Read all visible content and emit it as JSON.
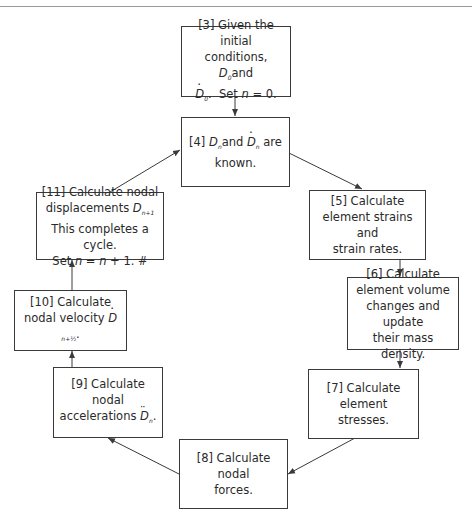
{
  "diagram": {
    "type": "cycle-flowchart",
    "nodes": [
      {
        "id": "3",
        "label": "[3] Given the initial conditions, D0 and Ḋ0. Set n = 0.",
        "lines": [
          "[3] Given the initial",
          "conditions, ",
          "D",
          "0",
          " and",
          "D",
          "0",
          ". Set ",
          "n",
          " = 0."
        ]
      },
      {
        "id": "4",
        "label": "[4] Dn and Ḋn are known."
      },
      {
        "id": "5",
        "label": "[5] Calculate element strains and strain rates.",
        "lines": [
          "[5] Calculate",
          "element strains and",
          "strain rates."
        ]
      },
      {
        "id": "6",
        "label": "[6] Calculate element volume changes and update their mass density.",
        "lines": [
          "[6] Calculate",
          "element volume",
          "changes and update",
          "their mass density."
        ]
      },
      {
        "id": "7",
        "label": "[7] Calculate element stresses.",
        "lines": [
          "[7] Calculate",
          "element stresses."
        ]
      },
      {
        "id": "8",
        "label": "[8] Calculate nodal forces.",
        "lines": [
          "[8] Calculate nodal",
          "forces."
        ]
      },
      {
        "id": "9",
        "label": "[9] Calculate nodal accelerations D̈n.",
        "lines": [
          "[9] Calculate nodal",
          "accelerations "
        ]
      },
      {
        "id": "10",
        "label": "[10] Calculate nodal velocity Ḋn+1/2.",
        "lines": [
          "[10] Calculate",
          "nodal velocity "
        ]
      },
      {
        "id": "11",
        "label": "[11] Calculate nodal displacements Dn+1. This completes a cycle. Set n = n + 1. #",
        "lines": [
          "[11] Calculate nodal",
          "displacements ",
          "This completes a cycle.",
          "Set ",
          "n",
          " = ",
          "n",
          " + 1. #"
        ]
      }
    ],
    "edges": [
      {
        "from": "3",
        "to": "4"
      },
      {
        "from": "4",
        "to": "5"
      },
      {
        "from": "5",
        "to": "6"
      },
      {
        "from": "6",
        "to": "7"
      },
      {
        "from": "7",
        "to": "8"
      },
      {
        "from": "8",
        "to": "9"
      },
      {
        "from": "9",
        "to": "10"
      },
      {
        "from": "10",
        "to": "11"
      },
      {
        "from": "11",
        "to": "4"
      }
    ]
  },
  "text": {
    "n3_l1": "[3] Given the initial",
    "n3_l2a": "conditions,",
    "D": "D",
    "sub0": "0",
    "subn": "n",
    "subn1": "n+1",
    "subnhalf": "n+½",
    "and": "and",
    "are": "are",
    "period": ".",
    "set": "Set",
    "n": "n",
    "eq0": "= 0.",
    "n4_l1a": "[4]",
    "n4_l2": "known.",
    "n5_l1": "[5] Calculate",
    "n5_l2": "element strains and",
    "n5_l3": "strain rates.",
    "n6_l1": "[6] Calculate",
    "n6_l2": "element volume",
    "n6_l3": "changes and update",
    "n6_l4": "their mass density.",
    "n7_l1": "[7] Calculate",
    "n7_l2": "element stresses.",
    "n8_l1": "[8] Calculate nodal",
    "n8_l2": "forces.",
    "n9_l1": "[9] Calculate nodal",
    "n9_l2": "accelerations",
    "n10_l1": "[10] Calculate",
    "n10_l2": "nodal velocity",
    "n11_l1": "[11] Calculate nodal",
    "n11_l2": "displacements",
    "n11_l3": "This completes a cycle.",
    "eq": "=",
    "plus1": "+ 1. #"
  },
  "colors": {
    "stroke": "#3a3a3a",
    "text": "#2a2a2a",
    "background": "#ffffff",
    "rule": "#9a9a9a"
  }
}
